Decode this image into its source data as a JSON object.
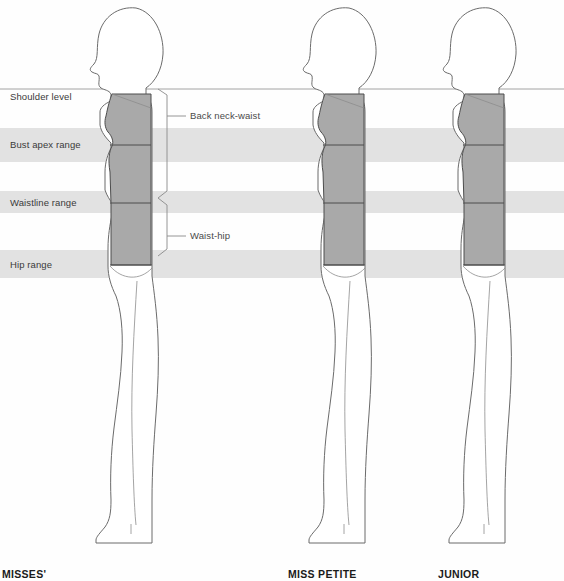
{
  "diagram": {
    "title_visible": false,
    "background_color": "#fefefe",
    "band_color": "#e0e0e0",
    "torso_fill": "#a9a9a9",
    "outline_color": "#6b6b6b",
    "reference_lines": [
      {
        "id": "shoulder",
        "label": "Shoulder level",
        "y": 97,
        "has_band": false
      },
      {
        "id": "bust",
        "label": "Bust apex range",
        "y": 145,
        "has_band": true
      },
      {
        "id": "waist",
        "label": "Waistline range",
        "y": 203,
        "has_band": true
      },
      {
        "id": "hip",
        "label": "Hip range",
        "y": 265,
        "has_band": true
      }
    ],
    "callouts": [
      {
        "id": "back-neck-waist",
        "label": "Back neck-waist",
        "x": 193,
        "y": 116
      },
      {
        "id": "waist-hip",
        "label": "Waist-hip",
        "x": 193,
        "y": 236
      }
    ],
    "figures": [
      {
        "id": "misses",
        "caption": "MISSES'",
        "caption_x": 2,
        "center_x": 128
      },
      {
        "id": "miss-petite",
        "caption": "MISS PETITE",
        "caption_x": 288,
        "center_x": 341
      },
      {
        "id": "junior",
        "caption": "JUNIOR",
        "caption_x": 438,
        "center_x": 481
      }
    ],
    "caption_baseline_y": 578
  }
}
